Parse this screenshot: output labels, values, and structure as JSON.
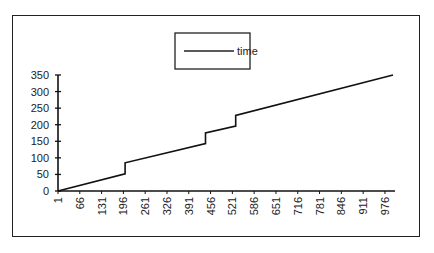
{
  "chart_data": {
    "type": "line",
    "title": "",
    "xlabel": "",
    "ylabel": "",
    "legend": {
      "entries": [
        "time"
      ],
      "position": "top-center"
    },
    "grid": false,
    "ylim": [
      0,
      350
    ],
    "xlim": [
      1,
      1000
    ],
    "y_ticks": [
      0,
      50,
      100,
      150,
      200,
      250,
      300,
      350
    ],
    "x_ticks": [
      1,
      66,
      131,
      196,
      261,
      326,
      391,
      456,
      521,
      586,
      651,
      716,
      781,
      846,
      911,
      976
    ],
    "series": [
      {
        "name": "time",
        "x": [
          1,
          201,
          201,
          441,
          441,
          531,
          531,
          1000
        ],
        "values": [
          0,
          52,
          85,
          143,
          175,
          196,
          228,
          350
        ]
      }
    ]
  },
  "legend_label": "time"
}
